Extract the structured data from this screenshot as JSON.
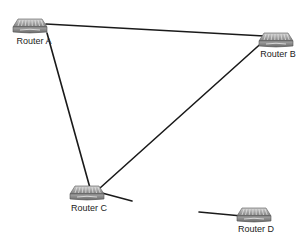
{
  "diagram": {
    "type": "network-topology",
    "nodes": [
      {
        "id": "A",
        "label": "Router A",
        "icon": "router-icon",
        "x": 30,
        "y": 25
      },
      {
        "id": "B",
        "label": "Router B",
        "icon": "router-icon",
        "x": 276,
        "y": 39
      },
      {
        "id": "C",
        "label": "Router C",
        "icon": "router-icon",
        "x": 87,
        "y": 192
      },
      {
        "id": "D",
        "label": "Router D",
        "icon": "router-icon",
        "x": 254,
        "y": 214
      }
    ],
    "links": [
      {
        "from": "A",
        "to": "B",
        "x1": 46,
        "y1": 24,
        "x2": 264,
        "y2": 36
      },
      {
        "from": "A",
        "to": "C",
        "x1": 47,
        "y1": 33,
        "x2": 90,
        "y2": 188
      },
      {
        "from": "B",
        "to": "C",
        "x1": 266,
        "y1": 39,
        "x2": 100,
        "y2": 188
      },
      {
        "from": "C",
        "to": null,
        "x1": 102,
        "y1": 193,
        "x2": 132,
        "y2": 201
      },
      {
        "from": null,
        "to": "D",
        "x1": 199,
        "y1": 212,
        "x2": 242,
        "y2": 216
      }
    ],
    "colors": {
      "line": "#1a1a1a",
      "router_body": "#9a9a9a",
      "label": "#222222"
    }
  }
}
